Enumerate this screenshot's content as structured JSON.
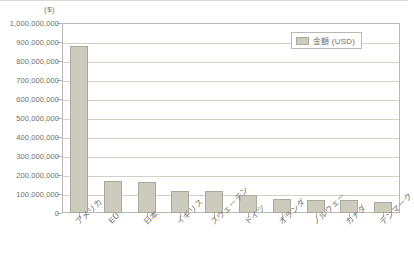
{
  "chart_data": {
    "type": "bar",
    "title": "",
    "subtitle": "",
    "unit_label": "($)",
    "xlabel": "",
    "ylabel": "",
    "ylim": [
      0,
      1000000000
    ],
    "grid": true,
    "legend_position": "top-right",
    "categories": [
      "アメリカ",
      "EU",
      "日本",
      "イギリス",
      "スウェーデン",
      "ドイツ",
      "オランダ",
      "ノルウェー",
      "カナダ",
      "デンマーク"
    ],
    "values": [
      880000000,
      170000000,
      163000000,
      118000000,
      115000000,
      95000000,
      72000000,
      70000000,
      68000000,
      60000000
    ],
    "series": [
      {
        "name": "金額 (USD)",
        "values": [
          880000000,
          170000000,
          163000000,
          118000000,
          115000000,
          95000000,
          72000000,
          70000000,
          68000000,
          60000000
        ]
      }
    ],
    "ytick_labels": [
      "1,000,000,000",
      "900,000,000",
      "800,000,000",
      "700,000,000",
      "600,000,000",
      "500,000,000",
      "400,000,000",
      "300,000,000",
      "200,000,000",
      "100,000,000",
      "0"
    ],
    "ytick_values": [
      1000000000,
      900000000,
      800000000,
      700000000,
      600000000,
      500000000,
      400000000,
      300000000,
      200000000,
      100000000,
      0
    ],
    "colors": {
      "bar_fill": "#cccbbd",
      "bar_border": "#a9a99c",
      "gridline": "#d2d2c9",
      "axis": "#b9b9b2",
      "text": "#6f6f68",
      "background": "#ffffff"
    }
  },
  "legend": {
    "entries": [
      {
        "label": "金額 (USD)",
        "color": "#cccbbd"
      }
    ]
  }
}
